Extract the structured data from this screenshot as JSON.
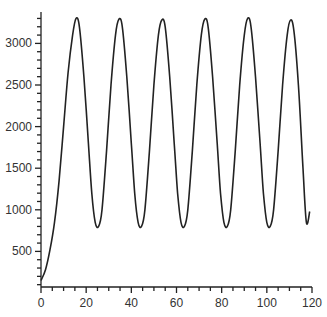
{
  "chart_data": {
    "type": "line",
    "title": "",
    "xlabel": "",
    "ylabel": "",
    "xlim": [
      0,
      120
    ],
    "ylim": [
      70,
      3380
    ],
    "grid": false,
    "legend": null,
    "x_ticks": [
      0,
      20,
      40,
      60,
      80,
      100,
      120
    ],
    "y_ticks": [
      500,
      1000,
      1500,
      2000,
      2500,
      3000
    ],
    "series": [
      {
        "name": "signal",
        "color": "#222222",
        "x": [
          0,
          2,
          4,
          6,
          8,
          10,
          12,
          14,
          15.5,
          17,
          19,
          21,
          22.5,
          24,
          25.5,
          27,
          29,
          31,
          33,
          34.5,
          36,
          38,
          40,
          41.5,
          43,
          44.5,
          46,
          48,
          50,
          52,
          53.5,
          55,
          57,
          59,
          60.5,
          62,
          63.5,
          65,
          67,
          69,
          71,
          72.5,
          74,
          76,
          78,
          79.5,
          81,
          82.5,
          84,
          86,
          88,
          90,
          91.5,
          93,
          95,
          97,
          98.5,
          100,
          101.5,
          103,
          105,
          107,
          109,
          110.5,
          112,
          114,
          116,
          117.5,
          119
        ],
        "y": [
          150,
          280,
          520,
          850,
          1350,
          2000,
          2650,
          3100,
          3300,
          3200,
          2600,
          1800,
          1200,
          850,
          800,
          1000,
          1700,
          2500,
          3100,
          3290,
          3200,
          2600,
          1800,
          1200,
          850,
          800,
          1000,
          1700,
          2500,
          3100,
          3280,
          3200,
          2600,
          1800,
          1200,
          850,
          800,
          1000,
          1700,
          2500,
          3100,
          3290,
          3200,
          2600,
          1800,
          1200,
          850,
          800,
          1000,
          1700,
          2500,
          3100,
          3300,
          3200,
          2600,
          1800,
          1200,
          850,
          800,
          1000,
          1700,
          2500,
          3100,
          3280,
          3150,
          2500,
          1500,
          850,
          980
        ]
      }
    ],
    "caption": ""
  },
  "axes": {
    "x_labels": [
      "0",
      "20",
      "40",
      "60",
      "80",
      "100",
      "120"
    ],
    "y_labels": [
      "500",
      "1000",
      "1500",
      "2000",
      "2500",
      "3000"
    ]
  },
  "colors": {
    "line": "#222222",
    "axis": "#222222",
    "background": "#ffffff"
  }
}
